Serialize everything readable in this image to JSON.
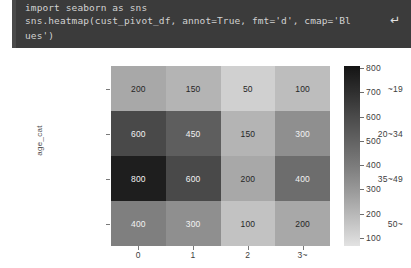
{
  "code_cell": {
    "line1": "import seaborn as sns",
    "line2": "sns.heatmap(cust_pivot_df, annot=True, fmt='d', cmap='Bl",
    "line3": "ues')",
    "wrap_indicator": "↵",
    "background": "#3b3b3b",
    "text_color": "#d2d2d2"
  },
  "chart_data": {
    "type": "heatmap",
    "title": "",
    "xlabel": "",
    "ylabel": "age_cat",
    "categories_x": [
      "0",
      "1",
      "2",
      "3~"
    ],
    "categories_y": [
      "~19",
      "20~34",
      "35~49",
      "50~"
    ],
    "values": [
      [
        200,
        150,
        50,
        100
      ],
      [
        600,
        450,
        150,
        300
      ],
      [
        800,
        600,
        200,
        400
      ],
      [
        400,
        300,
        100,
        200
      ]
    ],
    "annot": true,
    "fmt": "d",
    "cmap": "Blues",
    "grid": false,
    "colorbar": {
      "position": "right",
      "ticks": [
        800,
        700,
        600,
        500,
        400,
        300,
        200,
        100
      ],
      "vmin": 50,
      "vmax": 800,
      "orientation": "vertical"
    },
    "cell_colors": [
      [
        "#a8a8a8",
        "#b4b4b4",
        "#d0d0d0",
        "#bdbdbd"
      ],
      [
        "#494949",
        "#5e5e5e",
        "#b4b4b4",
        "#8f8f8f"
      ],
      [
        "#1e1e1e",
        "#494949",
        "#a8a8a8",
        "#6d6d6d"
      ],
      [
        "#7f7f7f",
        "#8f8f8f",
        "#c2c2c2",
        "#a8a8a8"
      ]
    ],
    "annot_colors": [
      [
        "#262626",
        "#262626",
        "#262626",
        "#262626"
      ],
      [
        "#f2f2f2",
        "#f2f2f2",
        "#262626",
        "#f2f2f2"
      ],
      [
        "#f2f2f2",
        "#f2f2f2",
        "#262626",
        "#f2f2f2"
      ],
      [
        "#f2f2f2",
        "#f2f2f2",
        "#262626",
        "#262626"
      ]
    ]
  }
}
